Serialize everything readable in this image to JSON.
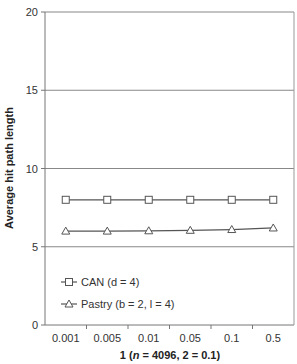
{
  "chart_data": {
    "type": "line",
    "title": "",
    "xlabel": "1 (n = 4096, 2 = 0.1)",
    "xlabel_parts": {
      "prefix": "1 (",
      "italic": "n",
      "suffix": " = 4096, 2 = 0.1)"
    },
    "ylabel": "Average hit path length",
    "categories": [
      "0.001",
      "0.005",
      "0.01",
      "0.05",
      "0.1",
      "0.5"
    ],
    "ylim": [
      0,
      20
    ],
    "yticks": [
      0,
      5,
      10,
      15,
      20
    ],
    "grid": true,
    "legend_position": "bottom-left",
    "series": [
      {
        "name": "CAN (d = 4)",
        "marker": "square",
        "values": [
          8.0,
          8.0,
          8.0,
          8.0,
          8.0,
          8.0
        ]
      },
      {
        "name": "Pastry (b = 2, l = 4)",
        "marker": "triangle",
        "values": [
          6.0,
          6.0,
          6.02,
          6.05,
          6.1,
          6.2
        ]
      }
    ]
  }
}
